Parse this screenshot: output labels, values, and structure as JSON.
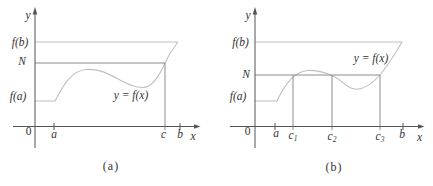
{
  "colors": {
    "axis": "#555555",
    "guide": "#8c8c8c",
    "curve": "#c0c0b8",
    "text": "#333333"
  },
  "panel_a": {
    "caption": "(a)",
    "y_axis_label": "y",
    "x_axis_label": "x",
    "origin_label": "0",
    "fb_label": "f(b)",
    "n_label": "N",
    "fa_label": "f(a)",
    "curve_label": "y = f(x)",
    "tick_a": "a",
    "tick_c": "c",
    "tick_b": "b"
  },
  "panel_b": {
    "caption": "(b)",
    "y_axis_label": "y",
    "x_axis_label": "x",
    "origin_label": "0",
    "fb_label": "f(b)",
    "n_label": "N",
    "fa_label": "f(a)",
    "curve_label": "y = f(x)",
    "tick_a": "a",
    "tick_c1": {
      "base": "c",
      "sub": "1"
    },
    "tick_c2": {
      "base": "c",
      "sub": "2"
    },
    "tick_c3": {
      "base": "c",
      "sub": "3"
    },
    "tick_b": "b"
  }
}
